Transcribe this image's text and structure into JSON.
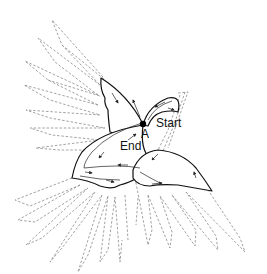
{
  "diagram": {
    "labels": {
      "point": "A",
      "start": "Start",
      "end": "End"
    },
    "colors": {
      "outline": "#111111",
      "feathers_dashed": "#8a8a8a",
      "background": "#ffffff"
    },
    "parts": [
      {
        "name": "upper-wing-left",
        "style": "dashed"
      },
      {
        "name": "lower-tail-feathers",
        "style": "dashed"
      },
      {
        "name": "right-tail-feathers",
        "style": "dashed"
      },
      {
        "name": "head-crest",
        "style": "solid"
      },
      {
        "name": "beak",
        "style": "solid"
      },
      {
        "name": "left-body-wing",
        "style": "solid"
      },
      {
        "name": "right-body-wing",
        "style": "solid"
      }
    ]
  }
}
